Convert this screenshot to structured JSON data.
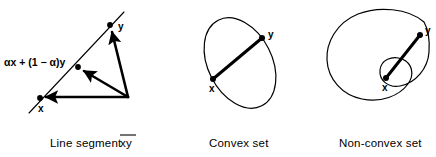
{
  "figure": {
    "background_color": "#ffffff",
    "ink_color": "#000000",
    "panels": [
      {
        "id": "line-segment",
        "caption": "Line segment ",
        "caption_overlined": "xy",
        "formula": "αx + (1 − α)y",
        "point_labels": {
          "x": "x",
          "y": "y"
        },
        "description": "Triangle with vector arrows from a common origin to x, to the convex combination point, and to y; a straight line passes through x, the combination point and y."
      },
      {
        "id": "convex-set",
        "caption": "Convex set",
        "point_labels": {
          "x": "x",
          "y": "y"
        },
        "description": "Tilted ellipse containing a thick straight segment joining x and y entirely inside the region."
      },
      {
        "id": "non-convex-set",
        "caption": "Non-convex set",
        "point_labels": {
          "x": "x",
          "y": "y"
        },
        "description": "Kidney shaped region with an S indentation; the thick straight segment joining x and y leaves the region."
      }
    ]
  }
}
